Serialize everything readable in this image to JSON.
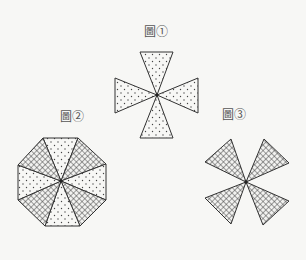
{
  "figures": [
    {
      "label": "圖①",
      "description": "Four dotted isosceles triangles meeting at a common apex (top, bottom, left, right)",
      "fill": "dotted"
    },
    {
      "label": "圖②",
      "description": "Regular octagon divided into 8 triangles from its center, alternating cross-hatched and dotted",
      "fill": "alternating"
    },
    {
      "label": "圖③",
      "description": "Four cross-hatched triangles meeting at a common apex in diagonal directions",
      "fill": "cross-hatched"
    }
  ],
  "colors": {
    "stroke": "#333333",
    "background": "#f7f7f5"
  }
}
